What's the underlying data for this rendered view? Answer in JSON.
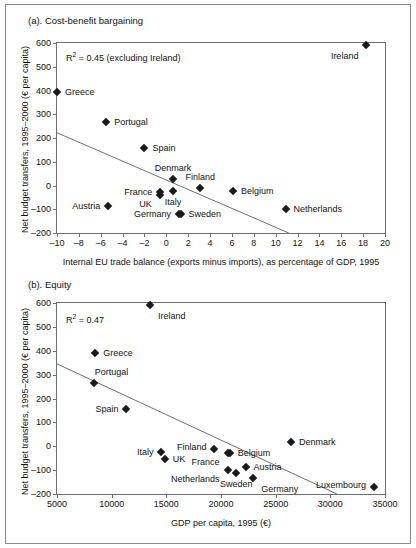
{
  "figure": {
    "panel_a_title": "(a). Cost-benefit bargaining",
    "panel_b_title": "(b). Equity"
  },
  "chart_data": [
    {
      "type": "scatter",
      "title": "(a). Cost-benefit bargaining",
      "xlabel": "Internal EU trade balance (exports minus imports), as percentage of GDP, 1995",
      "ylabel": "Net budget transfers, 1995–2000 (€ per capita)",
      "annotation": "R² = 0.45 (excluding Ireland)",
      "r2": 0.45,
      "xlim": [
        -10,
        20
      ],
      "ylim": [
        -200,
        600
      ],
      "xticks": [
        -10,
        -8,
        -6,
        -4,
        -2,
        0,
        2,
        4,
        6,
        8,
        10,
        12,
        14,
        16,
        18,
        20
      ],
      "xtick_labels": [
        "–10",
        "–8",
        "–6",
        "–4",
        "–2",
        "0",
        "2",
        "4",
        "6",
        "8",
        "10",
        "12",
        "14",
        "16",
        "18",
        "20"
      ],
      "yticks": [
        -200,
        -100,
        0,
        100,
        200,
        300,
        400,
        500,
        600
      ],
      "ytick_labels": [
        "–200",
        "–100",
        "0",
        "100",
        "200",
        "300",
        "400",
        "500",
        "600"
      ],
      "grid": false,
      "legend": "none",
      "fit_line": {
        "x0": -10,
        "y0": 222,
        "x1": 11.2,
        "y1": -200
      },
      "points": [
        {
          "label": "Ireland",
          "x": 18.3,
          "y": 592,
          "label_pos": "below-left"
        },
        {
          "label": "Greece",
          "x": -10.0,
          "y": 395,
          "label_pos": "right"
        },
        {
          "label": "Portugal",
          "x": -5.5,
          "y": 268,
          "label_pos": "right"
        },
        {
          "label": "Spain",
          "x": -2.0,
          "y": 158,
          "label_pos": "right"
        },
        {
          "label": "Denmark",
          "x": 0.6,
          "y": 28,
          "label_pos": "above"
        },
        {
          "label": "Finland",
          "x": 3.1,
          "y": -10,
          "label_pos": "above"
        },
        {
          "label": "Belgium",
          "x": 6.1,
          "y": -25,
          "label_pos": "right"
        },
        {
          "label": "France",
          "x": -0.55,
          "y": -28,
          "label_pos": "left"
        },
        {
          "label": "UK",
          "x": -0.6,
          "y": -42,
          "label_pos": "left-below"
        },
        {
          "label": "Italy",
          "x": 0.6,
          "y": -22,
          "label_pos": "below"
        },
        {
          "label": "Austria",
          "x": -5.3,
          "y": -85,
          "label_pos": "left"
        },
        {
          "label": "Netherlands",
          "x": 10.9,
          "y": -98,
          "label_pos": "right"
        },
        {
          "label": "Germany",
          "x": 1.15,
          "y": -120,
          "label_pos": "left"
        },
        {
          "label": "Sweden",
          "x": 1.3,
          "y": -118,
          "label_pos": "right"
        }
      ]
    },
    {
      "type": "scatter",
      "title": "(b). Equity",
      "xlabel": "GDP per capita, 1995 (€)",
      "ylabel": "Net budget transfers, 1995–2000 (€ per capita)",
      "annotation": "R² = 0.47",
      "r2": 0.47,
      "xlim": [
        5000,
        35000
      ],
      "ylim": [
        -200,
        600
      ],
      "xticks": [
        5000,
        10000,
        15000,
        20000,
        25000,
        30000,
        35000
      ],
      "xtick_labels": [
        "5000",
        "10000",
        "15000",
        "20000",
        "25000",
        "30000",
        "35000"
      ],
      "yticks": [
        -200,
        -100,
        0,
        100,
        200,
        300,
        400,
        500,
        600
      ],
      "ytick_labels": [
        "–200",
        "–100",
        "0",
        "100",
        "200",
        "300",
        "400",
        "500",
        "600"
      ],
      "grid": false,
      "legend": "none",
      "fit_line": {
        "x0": 5000,
        "y0": 345,
        "x1": 30600,
        "y1": -200
      },
      "points": [
        {
          "label": "Ireland",
          "x": 13500,
          "y": 592,
          "label_pos": "below-right"
        },
        {
          "label": "Greece",
          "x": 8500,
          "y": 390,
          "label_pos": "right"
        },
        {
          "label": "Portugal",
          "x": 8350,
          "y": 265,
          "label_pos": "above-right"
        },
        {
          "label": "Spain",
          "x": 11350,
          "y": 158,
          "label_pos": "left"
        },
        {
          "label": "Denmark",
          "x": 26400,
          "y": 16,
          "label_pos": "right"
        },
        {
          "label": "Finland",
          "x": 19400,
          "y": -12,
          "label_pos": "above-left"
        },
        {
          "label": "Belgium",
          "x": 20800,
          "y": -28,
          "label_pos": "right"
        },
        {
          "label": "France",
          "x": 20600,
          "y": -30,
          "label_pos": "left-below"
        },
        {
          "label": "Italy",
          "x": 14550,
          "y": -22,
          "label_pos": "left"
        },
        {
          "label": "UK",
          "x": 14850,
          "y": -52,
          "label_pos": "right"
        },
        {
          "label": "Austria",
          "x": 22250,
          "y": -88,
          "label_pos": "right"
        },
        {
          "label": "Netherlands",
          "x": 20600,
          "y": -99,
          "label_pos": "left-below"
        },
        {
          "label": "Sweden",
          "x": 21400,
          "y": -113,
          "label_pos": "below"
        },
        {
          "label": "Germany",
          "x": 22950,
          "y": -131,
          "label_pos": "below-right"
        },
        {
          "label": "Luxembourg",
          "x": 34000,
          "y": -170,
          "label_pos": "above-left"
        }
      ]
    }
  ]
}
